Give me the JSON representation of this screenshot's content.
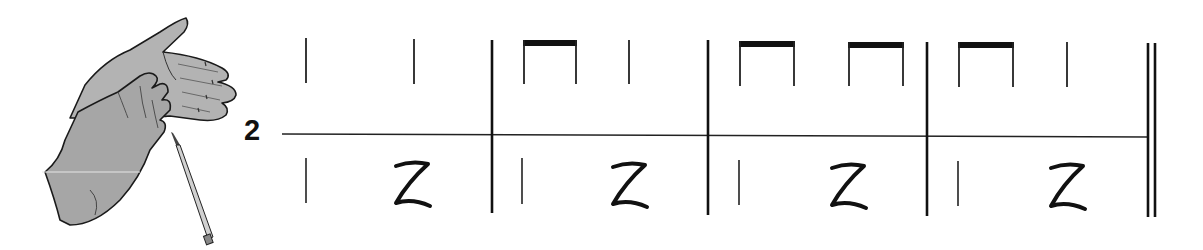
{
  "exercise": {
    "number": "2",
    "illustration": "clapping-hands-with-pencil",
    "colors": {
      "ink": "#111111",
      "hand_fill": "#a9a9a9",
      "hand_shadow": "#8c8c8c",
      "background": "#ffffff"
    }
  },
  "score": {
    "type": "two-line-rhythm",
    "measures": [
      {
        "index": 1,
        "upper": [
          "quarter",
          "quarter"
        ],
        "lower": [
          "quarter",
          "quarter-rest"
        ]
      },
      {
        "index": 2,
        "upper": [
          "eighth-pair",
          "quarter"
        ],
        "lower": [
          "quarter",
          "quarter-rest"
        ]
      },
      {
        "index": 3,
        "upper": [
          "eighth-pair",
          "eighth-pair"
        ],
        "lower": [
          "quarter",
          "quarter-rest"
        ]
      },
      {
        "index": 4,
        "upper": [
          "eighth-pair",
          "quarter"
        ],
        "lower": [
          "quarter",
          "quarter-rest"
        ]
      }
    ],
    "ending": "final-double-barline"
  }
}
